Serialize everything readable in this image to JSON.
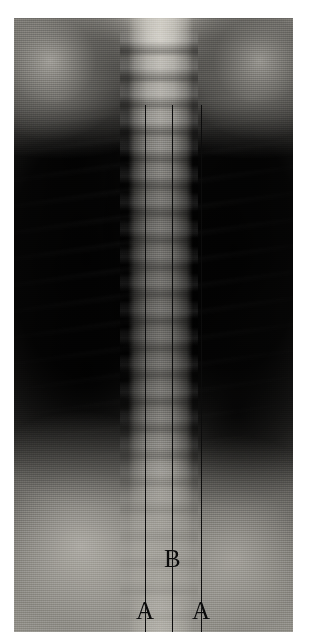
{
  "figure": {
    "type": "radiograph",
    "modality": "X-ray",
    "view": "anteroposterior-chest-thoracic-spine",
    "plate": {
      "left": 14,
      "top": 18,
      "width": 279,
      "height": 614,
      "background_color": "#ffffff",
      "film_dark_color": "#0a0a0a",
      "film_light_color": "#d4d1c9"
    }
  },
  "annotations": {
    "line_color": "#0c0c0c",
    "label_color": "#0b0b0b",
    "lines": [
      {
        "name": "left-paraspinal-line",
        "x": 131,
        "y_start": 87,
        "y_end": 614
      },
      {
        "name": "midline-spinous-line",
        "x": 158,
        "y_start": 87,
        "y_end": 614
      },
      {
        "name": "right-paraspinal-line",
        "x": 187,
        "y_start": 87,
        "y_end": 614
      }
    ],
    "labels": [
      {
        "id": "label-a-left",
        "text": "A",
        "x": 122,
        "y": 580
      },
      {
        "id": "label-b",
        "text": "B",
        "x": 150,
        "y": 528
      },
      {
        "id": "label-a-right",
        "text": "A",
        "x": 178,
        "y": 580
      }
    ],
    "legend": {
      "a_meaning": "A",
      "b_meaning": "B"
    }
  }
}
